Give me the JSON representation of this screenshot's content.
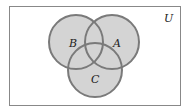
{
  "diagram": {
    "type": "venn",
    "universe_label": "U",
    "sets": [
      {
        "label": "B",
        "cx": 76,
        "cy": 42,
        "r": 27
      },
      {
        "label": "A",
        "cx": 112,
        "cy": 42,
        "r": 27
      },
      {
        "label": "C",
        "cx": 95,
        "cy": 70,
        "r": 27
      }
    ],
    "colors": {
      "fill": "#d4d4d4",
      "stroke": "#7a7a7a",
      "border": "#888888"
    }
  }
}
